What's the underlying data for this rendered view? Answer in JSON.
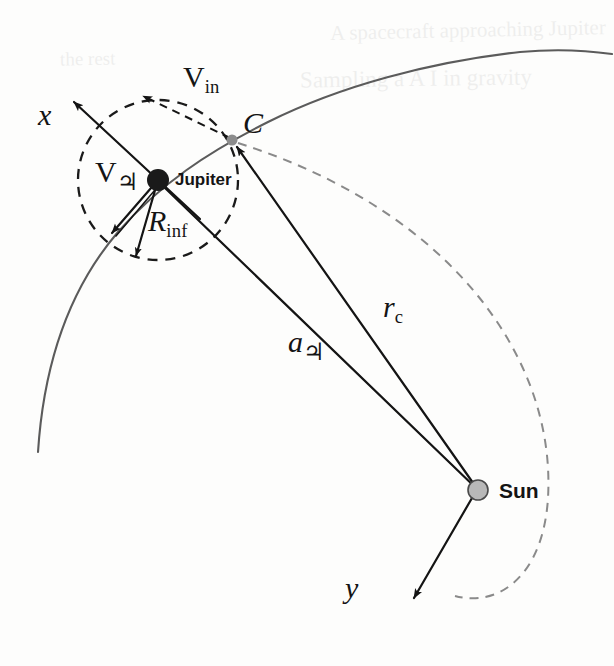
{
  "figure": {
    "domain": "diagram",
    "type": "orbital-mechanics-schematic",
    "background_color": "#fdfdfc",
    "ink_color": "#141414",
    "curve_color": "#5b5b5b"
  },
  "bodies": {
    "jupiter": {
      "label": "Jupiter",
      "marker": "filled-black-dot",
      "marker_color": "#1a1a1a",
      "x": 158,
      "y": 180,
      "radius_px": 11
    },
    "sun": {
      "label": "Sun",
      "marker": "filled-gray-dot",
      "marker_color": "#b3b3b3",
      "outline_color": "#4a4a4a",
      "x": 478,
      "y": 490,
      "radius_px": 10
    },
    "point_c": {
      "label": "C",
      "marker": "small-gray-dot",
      "marker_color": "#8c8c8c",
      "x": 232,
      "y": 140,
      "radius_px": 5.5
    }
  },
  "labels": {
    "x_axis": "x",
    "y_axis": "y",
    "point_c": "C",
    "jupiter": "Jupiter",
    "sun": "Sun",
    "v_in_base": "V",
    "v_in_sub": "in",
    "v_jupiter_base": "V",
    "v_jupiter_sub": "♃",
    "r_inf_base": "R",
    "r_inf_sub": "inf",
    "a_jupiter_base": "a",
    "a_jupiter_sub": "♃",
    "r_c_base": "r",
    "r_c_sub": "c"
  },
  "vectors": [
    {
      "name": "x-axis",
      "label": "x",
      "style": "solid",
      "from": [
        158,
        180
      ],
      "to": [
        72,
        100
      ],
      "arrowhead": "end"
    },
    {
      "name": "v-jupiter",
      "label": "V♃",
      "style": "solid",
      "from": [
        158,
        180
      ],
      "to": [
        113,
        232
      ],
      "arrowhead": "end"
    },
    {
      "name": "r-inf",
      "label": "Rinf",
      "style": "solid",
      "from": [
        158,
        180
      ],
      "to": [
        137,
        258
      ],
      "arrowhead": "end"
    },
    {
      "name": "v-in",
      "label": "Vin",
      "style": "dashed",
      "from": [
        232,
        140
      ],
      "to": [
        140,
        95
      ],
      "arrowhead": "end"
    },
    {
      "name": "a-jupiter",
      "label": "a♃",
      "style": "solid",
      "from": [
        478,
        490
      ],
      "to": [
        158,
        180
      ],
      "arrowhead": "none"
    },
    {
      "name": "r-c",
      "label": "rc",
      "style": "solid",
      "from": [
        478,
        490
      ],
      "to": [
        232,
        140
      ],
      "arrowhead": "end"
    },
    {
      "name": "y-axis",
      "label": "y",
      "style": "solid",
      "from": [
        478,
        490
      ],
      "to": [
        412,
        600
      ],
      "arrowhead": "end"
    }
  ],
  "curves": {
    "jupiter_orbit": {
      "name": "jupiter-orbit",
      "style": "solid",
      "color": "#5b5b5b",
      "description": "Jupiter's heliocentric orbit arc sweeping from lower left up to the upper right"
    },
    "sphere_of_influence": {
      "name": "sphere-of-influence",
      "style": "dashed",
      "color": "#1a1a1a",
      "center": [
        158,
        180
      ],
      "radius_px": 80,
      "description": "Dashed circle marking Jupiter's sphere of influence with radius R_inf"
    },
    "spacecraft_trajectory": {
      "name": "spacecraft-trajectory",
      "style": "dashed",
      "color": "#8a8a8a",
      "description": "Dashed heliocentric spacecraft trajectory leaving point C, curving right and down past the Sun"
    }
  },
  "bleed_through": [
    {
      "text": "A spacecraft approaching Jupiter",
      "x": 330,
      "y": 28,
      "size": 21,
      "rotate": -1.2
    },
    {
      "text": "Sampling a A I in gravity",
      "x": 300,
      "y": 76,
      "size": 23,
      "rotate": -0.8
    },
    {
      "text": "the rest",
      "x": 60,
      "y": 58,
      "size": 19,
      "rotate": -1.0
    }
  ]
}
